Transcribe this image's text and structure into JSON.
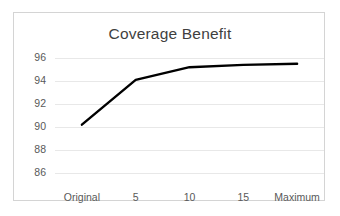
{
  "chart_data": {
    "type": "line",
    "title": "Coverage Benefit",
    "xlabel": "",
    "ylabel": "",
    "categories": [
      "Original",
      "5",
      "10",
      "15",
      "Maximum"
    ],
    "values": [
      90.2,
      94.1,
      95.2,
      95.4,
      95.5
    ],
    "series": [
      {
        "name": "Coverage Benefit",
        "values": [
          90.2,
          94.1,
          95.2,
          95.4,
          95.5
        ],
        "color": "#000000"
      }
    ],
    "ylim": [
      86,
      96
    ],
    "ytick_labels": [
      "96",
      "94",
      "92",
      "90",
      "88",
      "86"
    ],
    "ytick_values": [
      96,
      94,
      92,
      90,
      88,
      86
    ],
    "xtick_labels": [
      "Original",
      "5",
      "10",
      "15",
      "Maximum"
    ],
    "grid": true,
    "grid_axis": "y",
    "grid_color": "#e8e8e8",
    "legend": false,
    "legend_position": "none",
    "border_color": "#d4d4d4",
    "title_color": "#3f3f3f",
    "tick_color": "#595959",
    "markers": false
  }
}
